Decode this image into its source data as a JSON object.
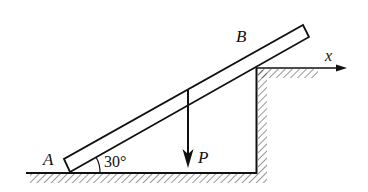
{
  "diagram": {
    "type": "statics-free-body-setup",
    "labels": {
      "point_a": "A",
      "point_b": "B",
      "axis_x": "x",
      "force": "P",
      "angle": "30°"
    },
    "angle_deg": 30,
    "colors": {
      "stroke": "#111111",
      "background": "#ffffff"
    },
    "elements": {
      "bar": "AB",
      "floor": "horizontal hatched ground",
      "wall": "vertical hatched step face",
      "ledge": "upper hatched surface with x-axis arrow",
      "load": "downward vertical force P"
    }
  }
}
